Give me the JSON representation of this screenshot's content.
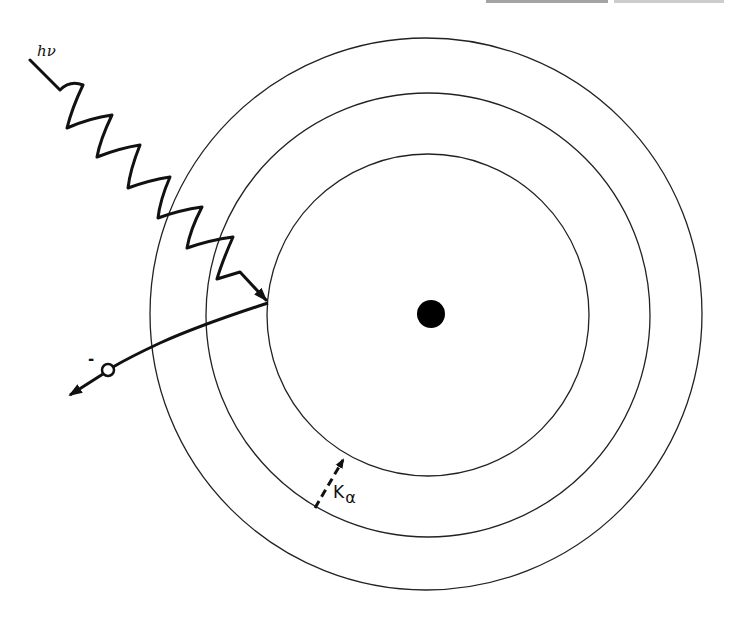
{
  "figure": {
    "type": "atomic-shell-diagram",
    "colors": {
      "line": "#111111",
      "background": "#ffffff"
    }
  },
  "labels": {
    "photon": "hν",
    "electron_charge": "-",
    "transition_main": "K",
    "transition_sub": "α"
  },
  "geometry": {
    "center": {
      "x": 428,
      "y": 314
    },
    "nucleus_radius": 14,
    "shells": [
      {
        "name": "K-shell",
        "r": 161
      },
      {
        "name": "L-shell",
        "r": 222
      },
      {
        "name": "M-shell",
        "r": 275
      }
    ]
  },
  "annotations": [
    {
      "id": "photon",
      "text": "hν",
      "meaning": "incident photon (wavy arrow)"
    },
    {
      "id": "electron",
      "text": "-",
      "meaning": "ejected photoelectron"
    },
    {
      "id": "k-alpha",
      "text": "Kα",
      "meaning": "L→K transition (dashed arrow)"
    }
  ]
}
